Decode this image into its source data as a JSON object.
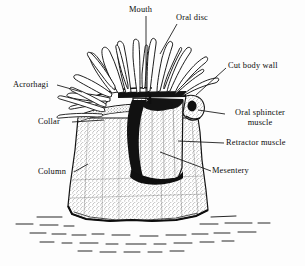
{
  "figure": {
    "background_color": "#fdfdfd",
    "ink_color": "#101010"
  },
  "labels": {
    "mouth": "Mouth",
    "oral_disc": "Oral disc",
    "cut_body_wall": "Cut body wall",
    "oral_sphincter_muscle": "Oral sphincter muscle",
    "retractor_muscle": "Retractor muscle",
    "mesentery": "Mesentery",
    "acrorhagi": "Acrorhagi",
    "collar": "Collar",
    "column": "Column"
  }
}
